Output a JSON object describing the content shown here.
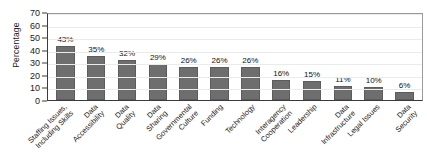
{
  "chart_data": {
    "type": "bar",
    "title": "",
    "xlabel": "",
    "ylabel": "Percentage",
    "ylim": [
      0,
      70
    ],
    "ytick_step": 10,
    "yticks": [
      70,
      60,
      50,
      40,
      30,
      20,
      10,
      0
    ],
    "grid": true,
    "legend": "none",
    "value_suffix": "%",
    "bar_color": "#6e6e6e",
    "plot_background": "#ffffff",
    "gridline_color": "#ebebeb",
    "axis_color": "#3b3b3b",
    "categories": [
      "Staffing Issues, Including Skills",
      "Data Accessibility",
      "Data Quality",
      "Data Sharing",
      "Governmental Culture",
      "Funding",
      "Technology",
      "Interagency Cooperation",
      "Leadership",
      "Data Infrastructure",
      "Legal Issues",
      "Data Security"
    ],
    "category_lines": [
      [
        "Staffing Issues,",
        "Including Skills"
      ],
      [
        "Data",
        "Accessibility"
      ],
      [
        "Data",
        "Quality"
      ],
      [
        "Data",
        "Sharing"
      ],
      [
        "Governmental",
        "Culture"
      ],
      [
        "Funding",
        ""
      ],
      [
        "Technology",
        ""
      ],
      [
        "Interagency",
        "Cooperation"
      ],
      [
        "Leadership",
        ""
      ],
      [
        "Data",
        "Infrastructure"
      ],
      [
        "Legal Issues",
        ""
      ],
      [
        "Data",
        "Security"
      ]
    ],
    "values": [
      43,
      35,
      32,
      29,
      26,
      26,
      26,
      16,
      15,
      11,
      10,
      6
    ],
    "data_labels": [
      "43%",
      "35%",
      "32%",
      "29%",
      "26%",
      "26%",
      "26%",
      "16%",
      "15%",
      "11%",
      "10%",
      "6%"
    ]
  }
}
